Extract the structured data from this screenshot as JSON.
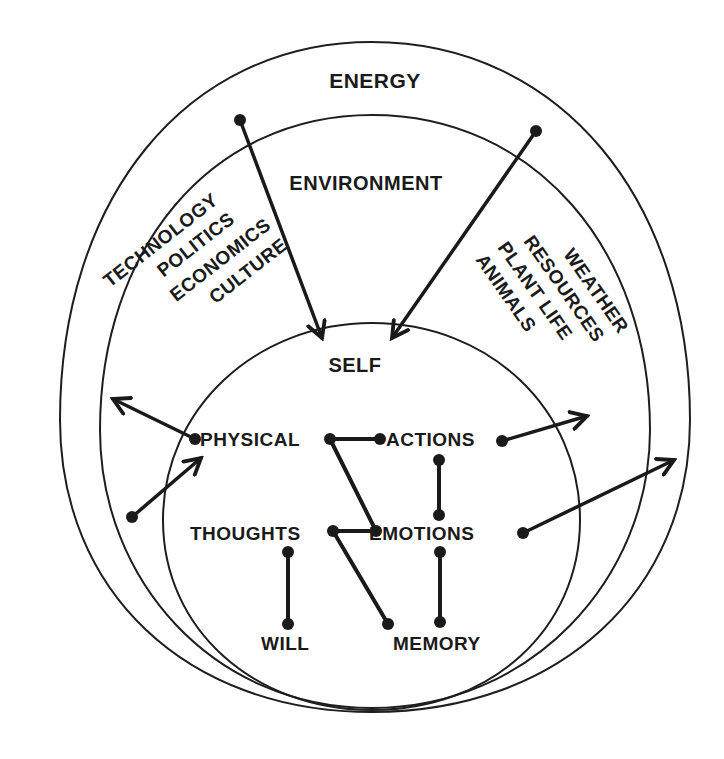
{
  "diagram": {
    "colors": {
      "ink": "#1a1a1a",
      "background": "#ffffff"
    },
    "outer_ring": {
      "label": "ENERGY"
    },
    "middle_ring": {
      "label": "ENVIRONMENT",
      "left_factors": [
        "TECHNOLOGY",
        "POLITICS",
        "ECONOMICS",
        "CULTURE"
      ],
      "right_factors": [
        "WEATHER",
        "RESOURCES",
        "PLANT LIFE",
        "ANIMALS"
      ]
    },
    "inner_ring": {
      "label": "SELF",
      "nodes": {
        "physical": "PHYSICAL",
        "actions": "ACTIONS",
        "thoughts": "THOUGHTS",
        "emotions": "EMOTIONS",
        "will": "WILL",
        "memory": "MEMORY"
      }
    },
    "connections": [
      {
        "from": "PHYSICAL",
        "to": "ACTIONS"
      },
      {
        "from": "PHYSICAL",
        "to": "EMOTIONS"
      },
      {
        "from": "ACTIONS",
        "to": "EMOTIONS"
      },
      {
        "from": "THOUGHTS",
        "to": "EMOTIONS"
      },
      {
        "from": "THOUGHTS",
        "to": "WILL"
      },
      {
        "from": "THOUGHTS",
        "to": "MEMORY"
      },
      {
        "from": "EMOTIONS",
        "to": "MEMORY"
      }
    ],
    "arrows": [
      {
        "from": "ENERGY (left)",
        "to": "SELF"
      },
      {
        "from": "ENERGY (right)",
        "to": "SELF"
      },
      {
        "from": "PHYSICAL",
        "to": "ENVIRONMENT (out, left)"
      },
      {
        "from": "ENVIRONMENT (left)",
        "to": "PHYSICAL"
      },
      {
        "from": "ACTIONS",
        "to": "ENVIRONMENT (out, right)"
      },
      {
        "from": "EMOTIONS",
        "to": "ENERGY (out, right)"
      }
    ]
  }
}
